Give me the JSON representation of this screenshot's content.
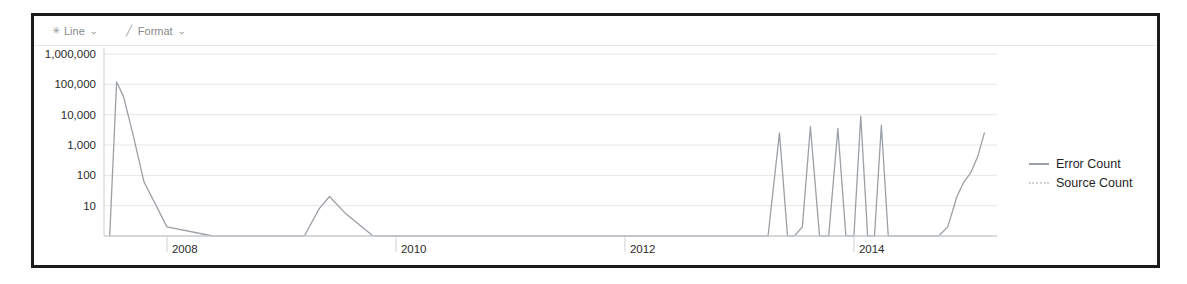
{
  "panel": {
    "background": "#ffffff",
    "border_color": "#1b1b1b"
  },
  "toolbar": {
    "buttons": [
      {
        "icon": "line-chart-icon",
        "glyph": "✳",
        "label": "Line",
        "caret": "⌄"
      },
      {
        "icon": "format-paint-icon",
        "glyph": "╱",
        "label": "Format",
        "caret": "⌄"
      }
    ]
  },
  "legend": {
    "position": "right",
    "items": [
      {
        "label": "Error Count",
        "color": "#9aa0a6",
        "style": "solid"
      },
      {
        "label": "Source Count",
        "color": "#cfd4d8",
        "style": "dotted"
      }
    ]
  },
  "chart_data": {
    "type": "line",
    "title": "",
    "xlabel": "_time",
    "ylabel": "",
    "yscale": "log",
    "ylim": [
      1,
      1000000
    ],
    "grid": true,
    "legend_position": "right",
    "ytick_labels": [
      "1,000,000",
      "100,000",
      "10,000",
      "1,000",
      "100",
      "10"
    ],
    "ytick_values": [
      1000000,
      100000,
      10000,
      1000,
      100,
      10
    ],
    "xtick_labels": [
      "2008",
      "2010",
      "2012",
      "2014"
    ],
    "xtick_values": [
      2008,
      2010,
      2012,
      2014
    ],
    "xlim": [
      2007.45,
      2015.25
    ],
    "series": [
      {
        "name": "Error Count",
        "color": "#9aa0a6",
        "style": "solid",
        "x": [
          2007.5,
          2007.56,
          2007.62,
          2007.7,
          2007.8,
          2008.0,
          2008.4,
          2008.9,
          2009.2,
          2009.33,
          2009.42,
          2009.55,
          2009.8,
          2010.3,
          2010.9,
          2011.5,
          2012.1,
          2012.7,
          2013.05,
          2013.25,
          2013.35,
          2013.42,
          2013.48,
          2013.55,
          2013.62,
          2013.7,
          2013.78,
          2013.86,
          2013.93,
          2014.0,
          2014.06,
          2014.12,
          2014.18,
          2014.24,
          2014.3,
          2014.36,
          2014.42,
          2014.5,
          2014.58,
          2014.66,
          2014.74,
          2014.82,
          2014.9,
          2014.96,
          2015.02,
          2015.08,
          2015.14
        ],
        "y": [
          1,
          120000,
          40000,
          2500,
          60,
          2,
          1,
          1,
          1,
          8,
          20,
          6,
          1,
          1,
          1,
          1,
          1,
          1,
          1,
          1,
          2500,
          1,
          1,
          2,
          4000,
          1,
          1,
          3500,
          1,
          1,
          9000,
          1,
          1,
          4500,
          1,
          1,
          1,
          1,
          1,
          1,
          1,
          2,
          20,
          60,
          120,
          400,
          2500
        ]
      },
      {
        "name": "Source Count",
        "color": "#cfd4d8",
        "style": "dotted",
        "x": [
          2007.5,
          2008.0,
          2009.0,
          2010.0,
          2011.0,
          2012.0,
          2013.0,
          2014.0,
          2015.0,
          2015.2
        ],
        "y": [
          1,
          1,
          1,
          1,
          1,
          1,
          1,
          1,
          1,
          1
        ]
      }
    ]
  }
}
